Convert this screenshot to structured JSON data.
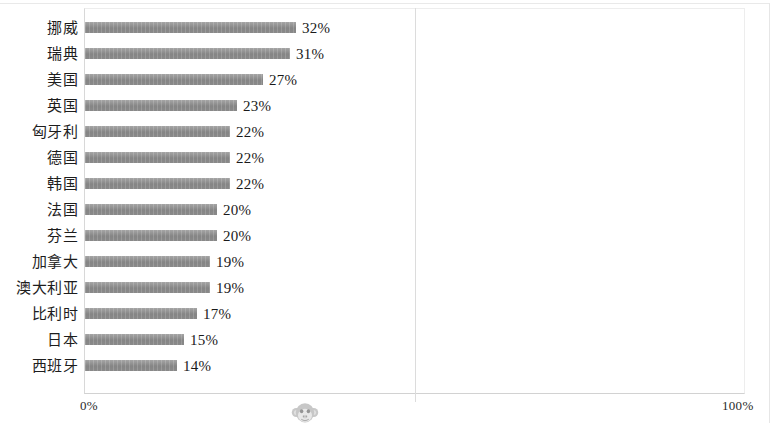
{
  "chart_data": {
    "type": "bar",
    "orientation": "horizontal",
    "title": "",
    "subtitle": "",
    "xlabel": "",
    "ylabel": "",
    "xlim": [
      0,
      100
    ],
    "grid": true,
    "legend": null,
    "legend_position": "none",
    "value_suffix": "%",
    "categories": [
      "挪威",
      "瑞典",
      "美国",
      "英国",
      "匈牙利",
      "德国",
      "韩国",
      "法国",
      "芬兰",
      "加拿大",
      "澳大利亚",
      "比利时",
      "日本",
      "西班牙"
    ],
    "values": [
      32,
      31,
      27,
      23,
      22,
      22,
      22,
      20,
      20,
      19,
      19,
      17,
      15,
      14
    ],
    "data_labels": [
      "32%",
      "31%",
      "27%",
      "23%",
      "22%",
      "22%",
      "22%",
      "20%",
      "20%",
      "19%",
      "19%",
      "17%",
      "15%",
      "14%"
    ],
    "x_tick_labels": [
      "0%",
      "100%"
    ],
    "x_tick_values": [
      0,
      100
    ],
    "gridline_values": [
      50
    ],
    "bar_color": "#8c8c8c",
    "gridline_color": "#dcdcdc",
    "plot_border_color": "#ededed",
    "background_color": "#ffffff",
    "text_color": "#1a1a1a"
  },
  "axis": {
    "tick_left": "0%",
    "tick_right": "100%"
  },
  "watermark": {
    "name": "monkey-face-watermark",
    "color": "#9a9a9a"
  }
}
